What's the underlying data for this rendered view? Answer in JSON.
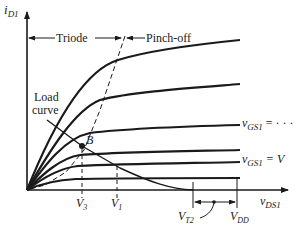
{
  "diagram": {
    "type": "MOSFET output characteristics with load curve",
    "y_axis": {
      "label": "i",
      "sub": "D1"
    },
    "x_axis": {
      "label": "v",
      "sub": "DS1"
    },
    "regions": {
      "triode": "Triode",
      "pinchoff": "Pinch-off"
    },
    "load_curve_label": {
      "line1": "Load",
      "line2": "curve"
    },
    "operating_point": "B",
    "curve_labels": [
      {
        "v": "v",
        "sub": "GS1",
        "rest": " = · · ·"
      },
      {
        "v": "v",
        "sub": "GS1",
        "rest": " = V"
      }
    ],
    "x_ticks": [
      {
        "label": "V",
        "sub": "3"
      },
      {
        "label": "V",
        "sub": "1"
      },
      {
        "label": "V",
        "sub": "T2"
      },
      {
        "label": "V",
        "sub": "DD"
      }
    ],
    "colors": {
      "ink": "#1a1a1a",
      "background": "#ffffff"
    }
  }
}
